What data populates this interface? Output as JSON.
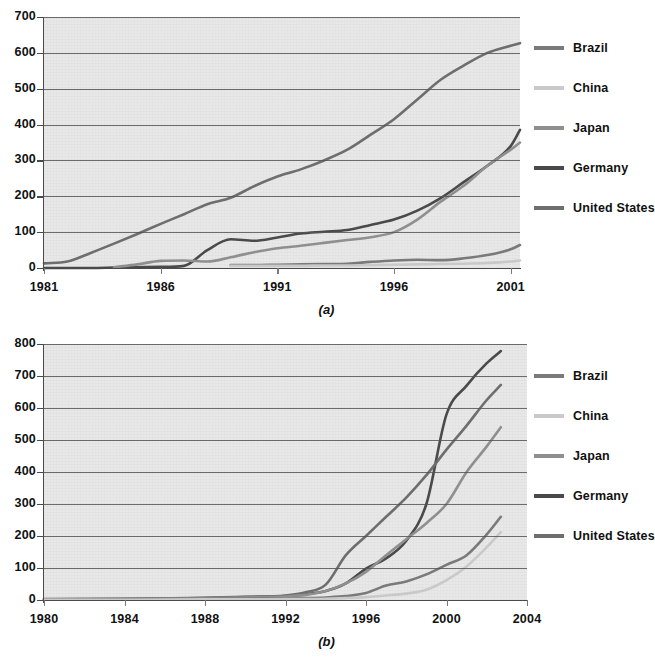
{
  "figure": {
    "panels": [
      {
        "id": "a",
        "caption": "(a)"
      },
      {
        "id": "b",
        "caption": "(b)"
      }
    ]
  },
  "legend": {
    "entries": [
      {
        "label": "Brazil",
        "color": "#7a7a7a"
      },
      {
        "label": "China",
        "color": "#c9c9c9"
      },
      {
        "label": "Japan",
        "color": "#8f8f8f"
      },
      {
        "label": "Germany",
        "color": "#4a4a4a"
      },
      {
        "label": "United States",
        "color": "#6e6e6e"
      }
    ]
  },
  "chart_data": [
    {
      "id": "a",
      "type": "line",
      "title": "",
      "caption": "(a)",
      "xlabel": "",
      "ylabel": "",
      "xlim": [
        1981,
        2001.4
      ],
      "ylim": [
        0,
        700
      ],
      "xticks": [
        1981,
        1986,
        1991,
        1996,
        2001
      ],
      "xticklabels": [
        "1981",
        "1986",
        "1991",
        "1996",
        "2001"
      ],
      "yticks": [
        0,
        100,
        200,
        300,
        400,
        500,
        600,
        700
      ],
      "yticklabels": [
        "0",
        "100",
        "200",
        "300",
        "400",
        "500",
        "600",
        "700"
      ],
      "grid": true,
      "legend_position": "right",
      "series": [
        {
          "name": "United States",
          "color": "#6e6e6e",
          "x": [
            1981,
            1982,
            1983,
            1984,
            1985,
            1986,
            1987,
            1988,
            1989,
            1990,
            1991,
            1992,
            1993,
            1994,
            1995,
            1996,
            1997,
            1998,
            1999,
            2000,
            2001,
            2001.4
          ],
          "values": [
            13,
            18,
            42,
            68,
            95,
            123,
            150,
            178,
            196,
            228,
            255,
            275,
            300,
            330,
            372,
            415,
            470,
            525,
            565,
            600,
            620,
            627
          ]
        },
        {
          "name": "Germany",
          "color": "#4a4a4a",
          "x": [
            1981,
            1982,
            1983,
            1984,
            1985,
            1986,
            1987,
            1988,
            1989,
            1990,
            1991,
            1992,
            1993,
            1994,
            1995,
            1996,
            1997,
            1998,
            1999,
            2000,
            2001,
            2001.4
          ],
          "values": [
            0,
            0,
            0,
            1,
            2,
            3,
            6,
            50,
            80,
            76,
            85,
            96,
            101,
            106,
            120,
            135,
            160,
            195,
            240,
            285,
            340,
            385
          ]
        },
        {
          "name": "Japan",
          "color": "#8f8f8f",
          "x": [
            1984,
            1985,
            1986,
            1987,
            1988,
            1989,
            1990,
            1991,
            1992,
            1993,
            1994,
            1995,
            1996,
            1997,
            1998,
            1999,
            2000,
            2001,
            2001.4
          ],
          "values": [
            2,
            10,
            20,
            21,
            18,
            30,
            44,
            55,
            62,
            70,
            78,
            86,
            100,
            135,
            185,
            230,
            285,
            330,
            350
          ]
        },
        {
          "name": "Brazil",
          "color": "#7a7a7a",
          "x": [
            1989,
            1990,
            1991,
            1992,
            1993,
            1994,
            1995,
            1996,
            1997,
            1998,
            1999,
            2000,
            2001,
            2001.4
          ],
          "values": [
            8,
            8,
            9,
            10,
            11,
            12,
            17,
            21,
            23,
            22,
            27,
            36,
            52,
            64
          ]
        },
        {
          "name": "China",
          "color": "#c9c9c9",
          "x": [
            1989,
            1990,
            1991,
            1992,
            1993,
            1994,
            1995,
            1996,
            1997,
            1998,
            1999,
            2000,
            2001,
            2001.4
          ],
          "values": [
            6,
            6,
            6,
            6,
            7,
            7,
            8,
            9,
            10,
            11,
            12,
            14,
            18,
            21
          ]
        }
      ]
    },
    {
      "id": "b",
      "type": "line",
      "title": "",
      "caption": "(b)",
      "xlabel": "",
      "ylabel": "",
      "xlim": [
        1980,
        2004
      ],
      "ylim": [
        0,
        800
      ],
      "xticks": [
        1980,
        1984,
        1988,
        1992,
        1996,
        2000,
        2004
      ],
      "xticklabels": [
        "1980",
        "1984",
        "1988",
        "1992",
        "1996",
        "2000",
        "2004"
      ],
      "yticks": [
        0,
        100,
        200,
        300,
        400,
        500,
        600,
        700,
        800
      ],
      "yticklabels": [
        "0",
        "100",
        "200",
        "300",
        "400",
        "500",
        "600",
        "700",
        "800"
      ],
      "grid": true,
      "legend_position": "right",
      "series": [
        {
          "name": "Germany",
          "color": "#4a4a4a",
          "x": [
            1980,
            1984,
            1988,
            1990,
            1992,
            1993,
            1994,
            1995,
            1996,
            1997,
            1998,
            1999,
            2000,
            2001,
            2002,
            2002.7
          ],
          "values": [
            2,
            3,
            6,
            9,
            12,
            18,
            28,
            52,
            98,
            130,
            185,
            300,
            580,
            670,
            740,
            778
          ]
        },
        {
          "name": "United States",
          "color": "#6e6e6e",
          "x": [
            1980,
            1984,
            1988,
            1990,
            1992,
            1993,
            1994,
            1995,
            1996,
            1997,
            1998,
            1999,
            2000,
            2001,
            2002,
            2002.7
          ],
          "values": [
            3,
            4,
            7,
            10,
            14,
            24,
            48,
            140,
            200,
            260,
            320,
            390,
            470,
            545,
            625,
            672
          ]
        },
        {
          "name": "Japan",
          "color": "#8f8f8f",
          "x": [
            1980,
            1984,
            1988,
            1990,
            1992,
            1993,
            1994,
            1995,
            1996,
            1997,
            1998,
            1999,
            2000,
            2001,
            2002,
            2002.7
          ],
          "values": [
            2,
            3,
            5,
            8,
            11,
            16,
            28,
            52,
            88,
            140,
            190,
            240,
            300,
            400,
            480,
            540
          ]
        },
        {
          "name": "Brazil",
          "color": "#7a7a7a",
          "x": [
            1980,
            1984,
            1988,
            1990,
            1992,
            1993,
            1994,
            1995,
            1996,
            1997,
            1998,
            1999,
            2000,
            2001,
            2002,
            2002.7
          ],
          "values": [
            1,
            2,
            3,
            4,
            5,
            6,
            8,
            12,
            22,
            45,
            58,
            80,
            110,
            140,
            205,
            260
          ]
        },
        {
          "name": "China",
          "color": "#c9c9c9",
          "x": [
            1980,
            1984,
            1988,
            1990,
            1992,
            1993,
            1994,
            1995,
            1996,
            1997,
            1998,
            1999,
            2000,
            2001,
            2002,
            2002.7
          ],
          "values": [
            1,
            1,
            2,
            2,
            3,
            3,
            4,
            6,
            9,
            14,
            20,
            32,
            62,
            105,
            165,
            212
          ]
        }
      ]
    }
  ]
}
